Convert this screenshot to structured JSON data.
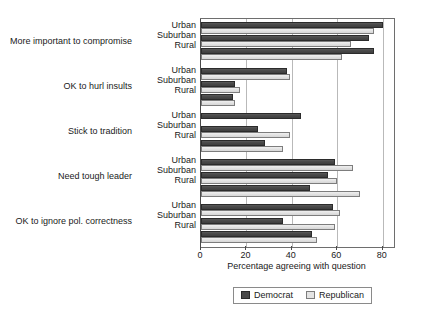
{
  "chart_data": {
    "type": "bar",
    "orientation": "horizontal",
    "title": "",
    "xlabel": "Percentage agreeing with question",
    "ylabel": "",
    "xlim": [
      0,
      85
    ],
    "xticks": [
      0,
      20,
      40,
      60,
      80
    ],
    "grid": true,
    "legend_position": "bottom",
    "groups": [
      "More important to compromise",
      "OK to hurl insults",
      "Stick to tradition",
      "Need tough leader",
      "OK to ignore pol. correctness"
    ],
    "subcategories": [
      "Urban",
      "Suburban",
      "Rural"
    ],
    "series": [
      {
        "name": "Democrat",
        "color": "#4a4a4a",
        "values": [
          [
            80,
            74,
            76
          ],
          [
            38,
            15,
            14
          ],
          [
            44,
            25,
            28
          ],
          [
            59,
            56,
            48
          ],
          [
            58,
            36,
            49
          ]
        ]
      },
      {
        "name": "Republican",
        "color": "#e2e2e2",
        "values": [
          [
            76,
            66,
            62
          ],
          [
            39,
            17,
            15
          ],
          [
            0,
            39,
            36
          ],
          [
            67,
            60,
            70
          ],
          [
            61,
            59,
            51
          ]
        ]
      }
    ],
    "legend": [
      "Democrat",
      "Republican"
    ]
  },
  "axis": {
    "tick_labels": [
      "0",
      "20",
      "40",
      "60",
      "80"
    ],
    "x_axis_title": "Percentage agreeing with question"
  },
  "legend": {
    "democrat_label": "Democrat",
    "republican_label": "Republican"
  },
  "categories": {
    "g0_label": "More important to compromise",
    "g1_label": "OK to hurl insults",
    "g2_label": "Stick to tradition",
    "g3_label": "Need tough leader",
    "g4_label": "OK to ignore pol. correctness",
    "urban": "Urban",
    "suburban": "Suburban",
    "rural": "Rural"
  }
}
